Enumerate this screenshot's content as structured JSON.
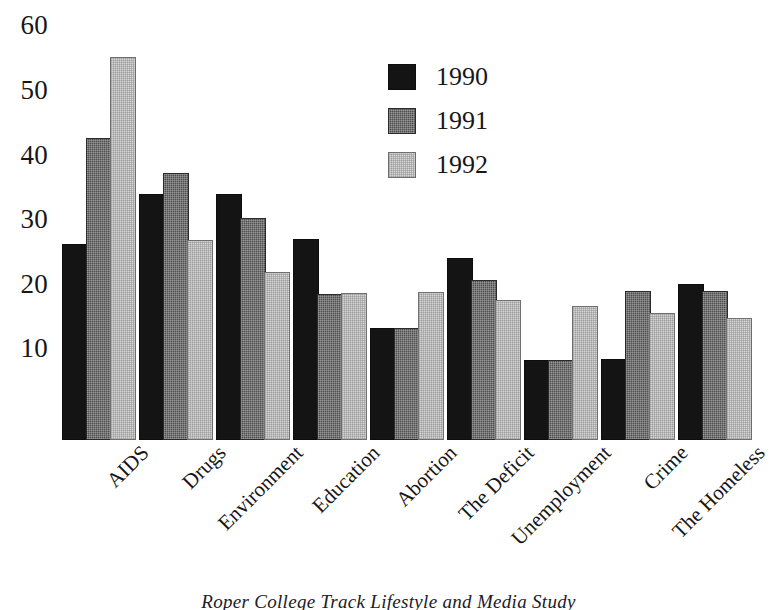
{
  "chart_data": {
    "type": "bar",
    "title": "",
    "subtitle": "",
    "xlabel": "",
    "ylabel": "",
    "grid": false,
    "legend_position": "inside-top-center",
    "ylim": [
      0,
      65
    ],
    "yticks": [
      10,
      20,
      30,
      40,
      50,
      60
    ],
    "ytick_labels": [
      "10",
      "20",
      "30",
      "40",
      "50",
      "60"
    ],
    "categories": [
      "AIDS",
      "Drugs",
      "Environment",
      "Education",
      "Abortion",
      "The Deficit",
      "Unemployment",
      "Crime",
      "The Homeless"
    ],
    "series": [
      {
        "name": "1990",
        "color": "#141414",
        "values": [
          30.0,
          37.8,
          37.8,
          30.8,
          17.0,
          27.9,
          12.0,
          12.2,
          23.8
        ]
      },
      {
        "name": "1991",
        "color": "#4f4f4f",
        "values": [
          46.5,
          41.0,
          34.0,
          22.3,
          17.0,
          24.5,
          12.0,
          22.7,
          22.8
        ]
      },
      {
        "name": "1992",
        "color": "#d5d5d5",
        "values": [
          59.0,
          30.6,
          25.7,
          22.4,
          22.6,
          21.4,
          20.5,
          19.3,
          18.5
        ]
      }
    ]
  },
  "legend": {
    "entries": [
      {
        "label": "1990"
      },
      {
        "label": "1991"
      },
      {
        "label": "1992"
      }
    ]
  },
  "caption": {
    "text": "Roper College Track Lifestyle and Media Study"
  }
}
